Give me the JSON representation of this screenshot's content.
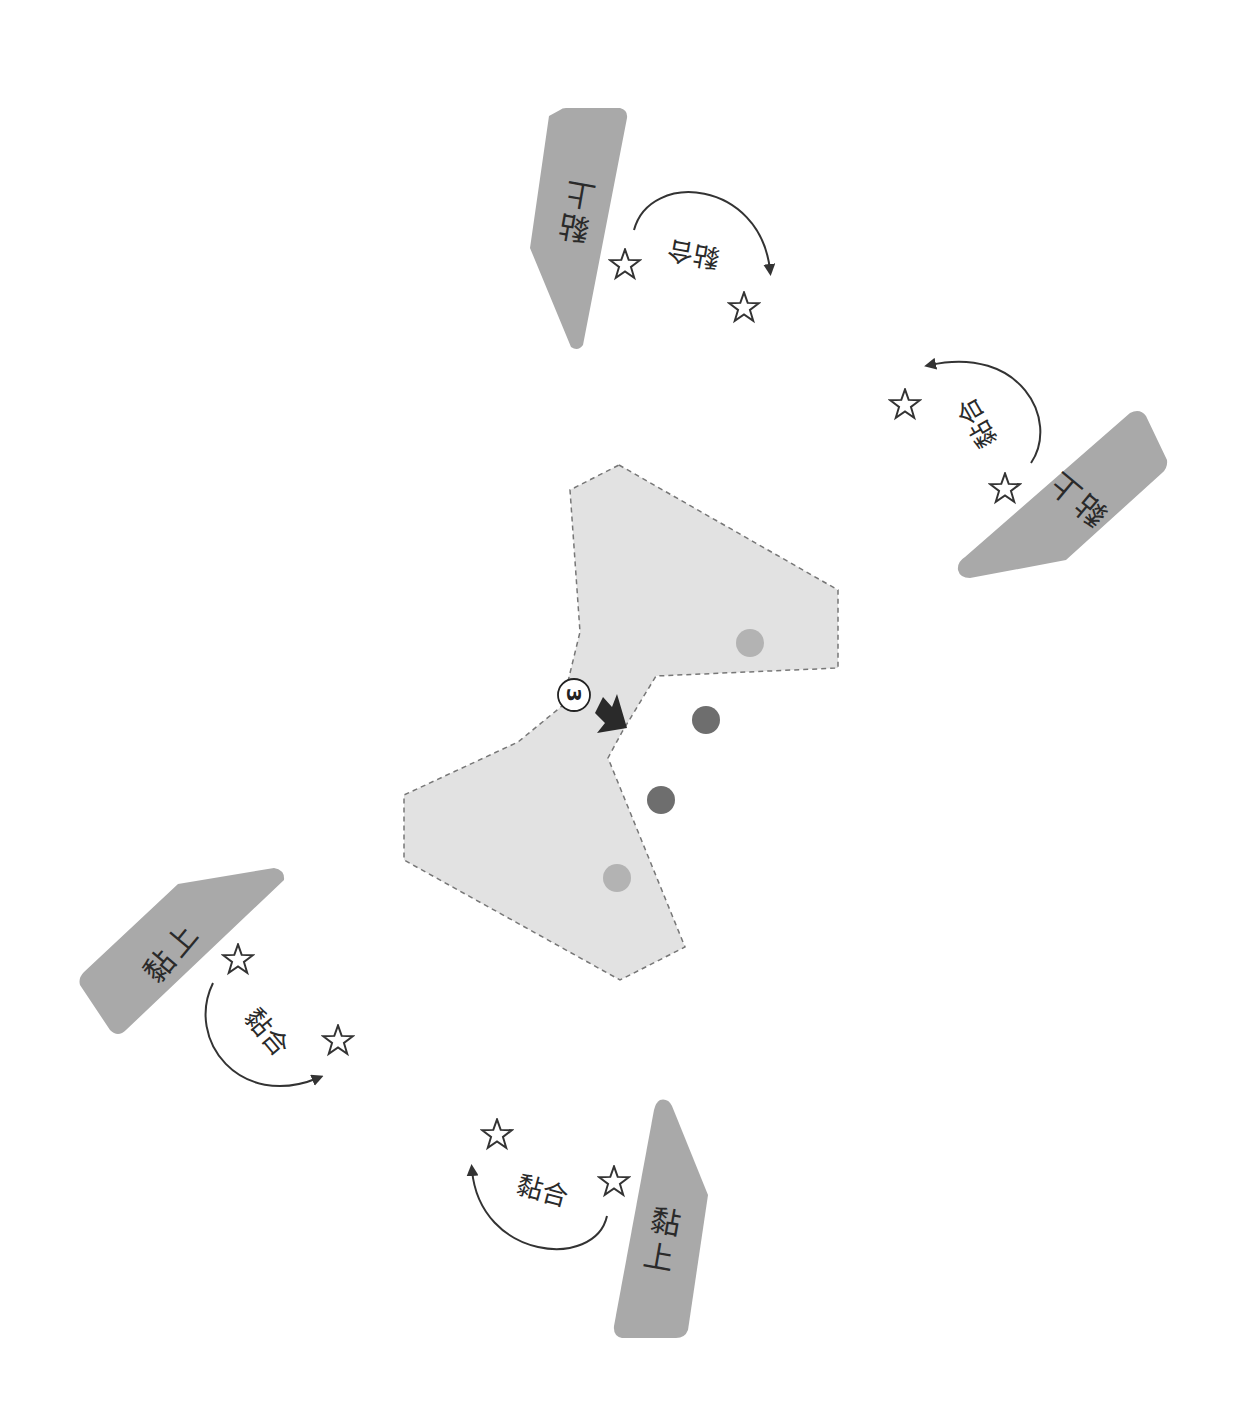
{
  "diagram": {
    "center_shape": {
      "fill": "#e2e2e2",
      "border": "#777777",
      "step_number": "3",
      "dots_inside": 2,
      "dots_outside": 2,
      "dot_inside_color": "#b3b3b3",
      "dot_outside_color": "#6e6e6e"
    },
    "tabs": [
      {
        "position": "top",
        "tab_text_1": "黏",
        "tab_text_2": "上",
        "arc_text": "黏合"
      },
      {
        "position": "right",
        "tab_text_1": "黏",
        "tab_text_2": "上",
        "arc_text": "黏合"
      },
      {
        "position": "bottom-left",
        "tab_text_1": "黏",
        "tab_text_2": "上",
        "arc_text": "黏合"
      },
      {
        "position": "bottom",
        "tab_text_1": "黏",
        "tab_text_2": "上",
        "arc_text": "黏合"
      }
    ],
    "colors": {
      "tab_fill": "#a9a9a9",
      "arrow": "#333333",
      "star_stroke": "#333333"
    }
  }
}
